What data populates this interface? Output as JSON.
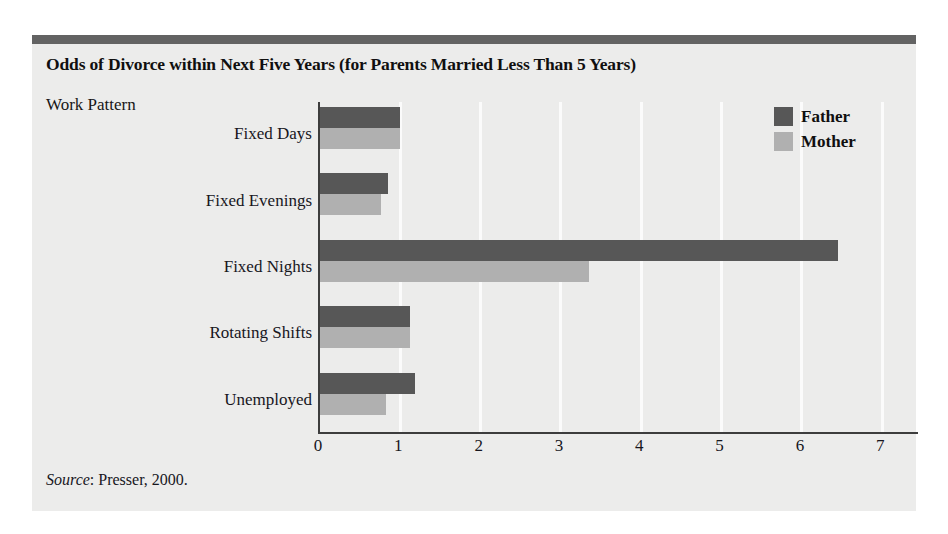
{
  "figure": {
    "title": "Odds of Divorce within Next Five Years (for Parents Married Less Than 5 Years)",
    "axis_group_title": "Work Pattern",
    "source_word": "Source",
    "source_rest": ": Presser, 2000."
  },
  "colors": {
    "panel_background": "#ececeb",
    "top_rule": "#636363",
    "father_bar": "#575757",
    "mother_bar": "#b0b0b0",
    "axis_line": "#3d3d3d",
    "gridline": "#fbfbfb",
    "text": "#17161d"
  },
  "chart_data": {
    "type": "bar",
    "orientation": "horizontal",
    "title": "Odds of Divorce within Next Five Years (for Parents Married Less Than 5 Years)",
    "xlabel": "",
    "ylabel": "Work Pattern",
    "categories": [
      "Fixed Days",
      "Fixed Evenings",
      "Fixed Nights",
      "Rotating Shifts",
      "Unemployed"
    ],
    "series": [
      {
        "name": "Father",
        "color": "#575757",
        "values": [
          1.0,
          0.85,
          6.45,
          1.12,
          1.18
        ]
      },
      {
        "name": "Mother",
        "color": "#b0b0b0",
        "values": [
          1.0,
          0.76,
          3.35,
          1.12,
          0.82
        ]
      }
    ],
    "xlim": [
      0,
      7.47
    ],
    "xticks": [
      0,
      1,
      2,
      3,
      4,
      5,
      6,
      7
    ],
    "xticklabels": [
      "0",
      "1",
      "2",
      "3",
      "4",
      "5",
      "6",
      "7"
    ],
    "gridlines": [
      1,
      2,
      3,
      4,
      5,
      6,
      7
    ],
    "grid": true,
    "legend_position": "top-right",
    "source": "Source: Presser, 2000."
  }
}
